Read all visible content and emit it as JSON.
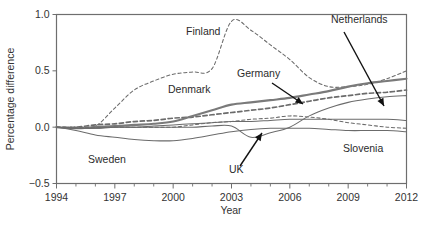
{
  "chart_data": {
    "type": "line",
    "title": "",
    "xlabel": "Year",
    "ylabel": "Percentage difference",
    "xlim": [
      1994,
      2012
    ],
    "ylim": [
      -0.5,
      1.0
    ],
    "ytick_labels": [
      "1.0",
      "0.5",
      "0.0",
      "-0.5"
    ],
    "ytick_values": [
      1.0,
      0.5,
      0.0,
      -0.5
    ],
    "xtick_labels": [
      "1994",
      "1997",
      "2000",
      "2003",
      "2006",
      "2009",
      "2012"
    ],
    "xtick_values": [
      1994,
      1997,
      2000,
      2003,
      2006,
      2009,
      2012
    ],
    "minor_xticks": [
      1995,
      1996,
      1998,
      1999,
      2001,
      2002,
      2004,
      2005,
      2007,
      2008,
      2010,
      2011
    ],
    "grid": false,
    "legend_position": "inline-annotations",
    "x": [
      1994,
      1995,
      1996,
      1997,
      1998,
      1999,
      2000,
      2001,
      2002,
      2003,
      2004,
      2005,
      2006,
      2007,
      2008,
      2009,
      2010,
      2011,
      2012
    ],
    "series": [
      {
        "name": "Finland",
        "style": "dashed",
        "values": [
          0.0,
          0.0,
          0.01,
          0.17,
          0.33,
          0.41,
          0.47,
          0.49,
          0.52,
          0.94,
          0.86,
          0.73,
          0.6,
          0.44,
          0.36,
          0.36,
          0.38,
          0.43,
          0.5
        ]
      },
      {
        "name": "Denmark",
        "style": "dashed-thick",
        "values": [
          0.0,
          0.0,
          0.02,
          0.03,
          0.05,
          0.06,
          0.08,
          0.09,
          0.11,
          0.13,
          0.15,
          0.17,
          0.2,
          0.23,
          0.26,
          0.28,
          0.3,
          0.31,
          0.33
        ]
      },
      {
        "name": "Germany",
        "style": "thick",
        "values": [
          0.0,
          -0.01,
          0.0,
          0.01,
          0.02,
          0.03,
          0.05,
          0.1,
          0.15,
          0.2,
          0.22,
          0.24,
          0.26,
          0.29,
          0.32,
          0.36,
          0.39,
          0.41,
          0.43
        ]
      },
      {
        "name": "Netherlands",
        "style": "thin",
        "values": [
          0.0,
          -0.01,
          -0.01,
          0.0,
          0.0,
          0.0,
          0.0,
          0.0,
          0.01,
          0.01,
          -0.09,
          -0.05,
          0.0,
          0.1,
          0.17,
          0.22,
          0.25,
          0.27,
          0.28
        ]
      },
      {
        "name": "UK",
        "style": "thin",
        "values": [
          0.0,
          -0.01,
          -0.01,
          0.0,
          0.0,
          0.01,
          0.02,
          0.03,
          0.04,
          0.05,
          0.05,
          0.06,
          0.07,
          0.07,
          0.07,
          0.07,
          0.07,
          0.07,
          0.06
        ]
      },
      {
        "name": "Slovenia",
        "style": "dashed",
        "values": [
          0.0,
          0.0,
          0.0,
          0.0,
          0.0,
          0.0,
          0.0,
          0.02,
          0.04,
          0.05,
          0.07,
          0.08,
          0.1,
          0.09,
          0.07,
          0.04,
          0.02,
          0.0,
          -0.01
        ]
      },
      {
        "name": "Sweden",
        "style": "thin",
        "values": [
          0.0,
          -0.03,
          -0.07,
          -0.09,
          -0.11,
          -0.12,
          -0.12,
          -0.1,
          -0.07,
          -0.04,
          -0.02,
          -0.01,
          -0.01,
          -0.01,
          -0.02,
          -0.03,
          -0.03,
          -0.03,
          -0.04
        ]
      }
    ],
    "annotations": [
      {
        "label": "Finland",
        "x": 186,
        "y": 35,
        "anchor": "start",
        "arrow": false
      },
      {
        "label": "Denmark",
        "x": 168,
        "y": 93,
        "anchor": "start",
        "arrow": false
      },
      {
        "label": "Sweden",
        "x": 88,
        "y": 163,
        "anchor": "start",
        "arrow": false
      },
      {
        "label": "Slovenia",
        "x": 343,
        "y": 152,
        "anchor": "start",
        "arrow": false
      },
      {
        "label": "Germany",
        "x": 237,
        "y": 77,
        "anchor": "start",
        "arrow": true,
        "ax": 272,
        "ay": 83,
        "tx": 303,
        "ty": 104
      },
      {
        "label": "Netherlands",
        "x": 331,
        "y": 23,
        "anchor": "start",
        "arrow": true,
        "ax": 344,
        "ay": 32,
        "tx": 384,
        "ty": 106
      },
      {
        "label": "UK",
        "x": 229,
        "y": 173,
        "anchor": "start",
        "arrow": true,
        "ax": 240,
        "ay": 166,
        "tx": 262,
        "ty": 133
      }
    ]
  }
}
